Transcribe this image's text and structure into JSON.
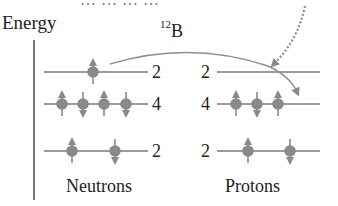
{
  "caption_clipped": "… … … …",
  "axis_label": "Energy",
  "nucleus": {
    "mass_number": "12",
    "symbol": "B"
  },
  "colors": {
    "line": "#7a7a7a",
    "particle": "#8a8a8a",
    "arrow": "#909090",
    "text": "#222222"
  },
  "neutrons": {
    "label": "Neutrons",
    "levels": [
      {
        "occupancy_label": "2",
        "particles": [
          {
            "spin": "up"
          }
        ]
      },
      {
        "occupancy_label": "4",
        "particles": [
          {
            "spin": "up"
          },
          {
            "spin": "down"
          },
          {
            "spin": "up"
          },
          {
            "spin": "down"
          }
        ]
      },
      {
        "occupancy_label": "2",
        "particles": [
          {
            "spin": "up"
          },
          {
            "spin": "down"
          }
        ]
      }
    ]
  },
  "protons": {
    "label": "Protons",
    "levels": [
      {
        "occupancy_label": "2",
        "particles": []
      },
      {
        "occupancy_label": "4",
        "particles": [
          {
            "spin": "up"
          },
          {
            "spin": "down"
          },
          {
            "spin": "up"
          }
        ]
      },
      {
        "occupancy_label": "2",
        "particles": [
          {
            "spin": "up"
          },
          {
            "spin": "down"
          }
        ]
      }
    ]
  },
  "transitions": [
    {
      "style": "solid",
      "from": "neutron top level",
      "to": "proton middle level"
    },
    {
      "style": "dotted",
      "from": "above (clipped text)",
      "to": "proton top level"
    }
  ]
}
